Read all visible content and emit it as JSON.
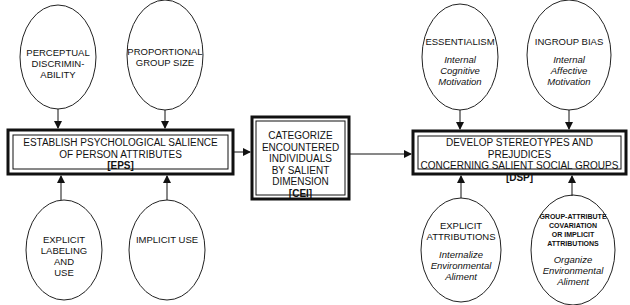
{
  "diagram": {
    "stages": [
      {
        "id": "EPS",
        "lines": [
          "ESTABLISH PSYCHOLOGICAL SALIENCE",
          "OF PERSON ATTRIBUTES"
        ],
        "code": "[EPS]"
      },
      {
        "id": "CEI",
        "lines": [
          "CATEGORIZE",
          "ENCOUNTERED",
          "INDIVIDUALS",
          "BY SALIENT DIMENSION"
        ],
        "code": "[CEI]"
      },
      {
        "id": "DSP",
        "lines": [
          "DEVELOP STEREOTYPES AND PREJUDICES",
          "CONCERNING SALIENT SOCIAL GROUPS"
        ],
        "code": "[DSP]"
      }
    ],
    "inputs": {
      "eps_top": [
        {
          "title": [
            "PERCEPTUAL",
            "DISCRIMIN-",
            "ABILITY"
          ]
        },
        {
          "title": [
            "PROPORTIONAL",
            "GROUP SIZE"
          ]
        }
      ],
      "eps_bottom": [
        {
          "title": [
            "EXPLICIT",
            "LABELING",
            "AND",
            "USE"
          ]
        },
        {
          "title": [
            "IMPLICIT USE"
          ]
        }
      ],
      "dsp_top": [
        {
          "title": [
            "ESSENTIALISM"
          ],
          "subtitle": [
            "Internal",
            "Cognitive",
            "Motivation"
          ]
        },
        {
          "title": [
            "INGROUP BIAS"
          ],
          "subtitle": [
            "Internal",
            "Affective",
            "Motivation"
          ]
        }
      ],
      "dsp_bottom": [
        {
          "title": [
            "EXPLICIT",
            "ATTRIBUTIONS"
          ],
          "subtitle": [
            "Internalize",
            "Environmental",
            "Aliment"
          ]
        },
        {
          "title": [
            "GROUP-ATTRIBUTE",
            "COVARIATION",
            "OR IMPLICIT",
            "ATTRIBUTIONS"
          ],
          "subtitle": [
            "Organize",
            "Environmental",
            "Aliment"
          ]
        }
      ]
    },
    "colors": {
      "line": "#111111",
      "background": "#ffffff"
    }
  }
}
